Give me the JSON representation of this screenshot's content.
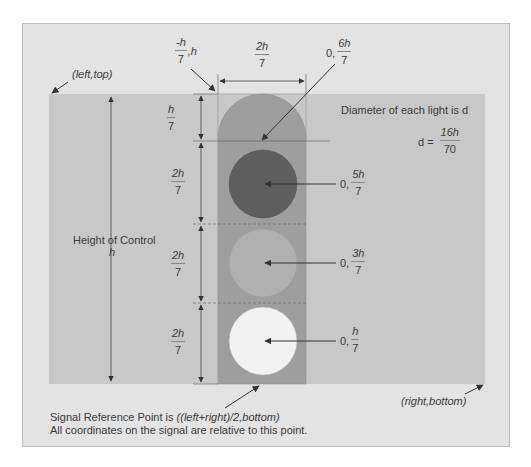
{
  "diagram": {
    "colors": {
      "page_background": "#ffffff",
      "panel_background": "#e3e3e3",
      "control_area": "#c8c8c8",
      "signal_body": "#9e9e9e",
      "light_top": "#5e5e5e",
      "light_middle": "#b0b0b0",
      "light_bottom": "#f2f2f2",
      "line": "#3a3a3a"
    },
    "corner_labels": {
      "top_left": "(left,top)",
      "bottom_right": "(right,bottom)"
    },
    "height_label": {
      "text": "Height of Control",
      "variable": "h"
    },
    "width_dimension": {
      "numerator": "2h",
      "denominator": "7"
    },
    "top_left_coordinate": {
      "numerator": "-h",
      "denominator": "7",
      "suffix": ",h"
    },
    "segment_dimensions": [
      {
        "numerator": "h",
        "denominator": "7"
      },
      {
        "numerator": "2h",
        "denominator": "7"
      },
      {
        "numerator": "2h",
        "denominator": "7"
      },
      {
        "numerator": "2h",
        "denominator": "7"
      }
    ],
    "point_labels": [
      {
        "prefix": "0,",
        "numerator": "6h",
        "denominator": "7"
      },
      {
        "prefix": "0,",
        "numerator": "5h",
        "denominator": "7"
      },
      {
        "prefix": "0,",
        "numerator": "3h",
        "denominator": "7"
      },
      {
        "prefix": "0,",
        "numerator": "h",
        "denominator": "7"
      }
    ],
    "diameter_note": {
      "text": "Diameter of each light is d",
      "equation_prefix": "d =",
      "numerator": "16h",
      "denominator": "70"
    },
    "footer": {
      "line1_prefix": "Signal Reference Point is ",
      "line1_formula": "((left+right)/2,bottom)",
      "line2": "All coordinates on the signal are relative to this point."
    }
  }
}
